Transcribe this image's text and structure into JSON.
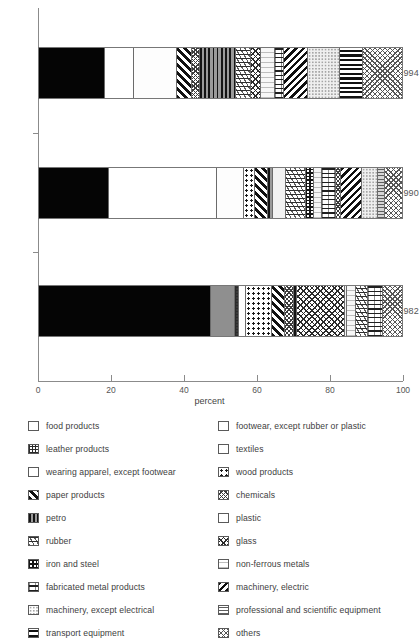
{
  "chart_data": {
    "type": "bar",
    "orientation": "horizontal",
    "stacked": true,
    "normalized_percent": true,
    "title": "",
    "xlabel": "percent",
    "ylabel": "",
    "xlim": [
      0,
      100
    ],
    "xticks": [
      0,
      20,
      40,
      60,
      80,
      100
    ],
    "grid": false,
    "legend_position": "bottom",
    "categories": [
      "1994",
      "1990",
      "1982"
    ],
    "series": [
      {
        "name": "food products",
        "key": "food",
        "values": [
          18.1,
          19.2,
          47.4
        ]
      },
      {
        "name": "footwear, except rubber or plastic",
        "key": "footwear",
        "values": [
          0.0,
          0.0,
          6.6
        ]
      },
      {
        "name": "leather products",
        "key": "leather",
        "values": [
          0.0,
          0.0,
          1.1
        ]
      },
      {
        "name": "textiles",
        "key": "textiles",
        "values": [
          8.2,
          29.8,
          1.9
        ]
      },
      {
        "name": "wearing apparel, except footwear",
        "key": "apparel",
        "values": [
          11.8,
          7.4,
          0.0
        ]
      },
      {
        "name": "wood products",
        "key": "wood",
        "values": [
          0.0,
          3.0,
          7.1
        ]
      },
      {
        "name": "paper products",
        "key": "paper",
        "values": [
          4.1,
          3.6,
          3.6
        ]
      },
      {
        "name": "chemicals",
        "key": "chem",
        "values": [
          2.2,
          1.6,
          2.5
        ]
      },
      {
        "name": "petro",
        "key": "petro",
        "values": [
          9.9,
          1.4,
          0.8
        ]
      },
      {
        "name": "plastic",
        "key": "plastic",
        "values": [
          0.0,
          3.6,
          0.5
        ]
      },
      {
        "name": "rubber",
        "key": "rubber",
        "values": [
          4.1,
          5.5,
          0.0
        ]
      },
      {
        "name": "glass",
        "key": "glass",
        "values": [
          2.7,
          0.0,
          13.4
        ]
      },
      {
        "name": "iron and steel",
        "key": "iron",
        "values": [
          0.0,
          2.2,
          0.0
        ]
      },
      {
        "name": "non-ferrous metals",
        "key": "nonferrous",
        "values": [
          3.8,
          2.2,
          2.5
        ]
      },
      {
        "name": "fabricated metal products",
        "key": "fabmetal",
        "values": [
          2.7,
          3.8,
          4.1
        ]
      },
      {
        "name": "machinery, electric",
        "key": "machelec",
        "values": [
          6.6,
          5.8,
          3.3
        ]
      },
      {
        "name": "machinery, except electrical",
        "key": "machexcl",
        "values": [
          8.8,
          4.4,
          0.0
        ]
      },
      {
        "name": "professional and scientific equipment",
        "key": "prof",
        "values": [
          0.0,
          1.9,
          0.0
        ]
      },
      {
        "name": "transport equipment",
        "key": "transport",
        "values": [
          6.3,
          0.0,
          0.0
        ]
      },
      {
        "name": "others",
        "key": "others",
        "values": [
          0.8,
          4.6,
          5.2
        ]
      }
    ],
    "bars": [
      {
        "label": "1994",
        "segments": [
          {
            "key": "food",
            "start": 0.0,
            "end": 18.1
          },
          {
            "key": "textiles",
            "start": 18.1,
            "end": 26.3
          },
          {
            "key": "apparel",
            "start": 26.3,
            "end": 38.1
          },
          {
            "key": "paper",
            "start": 38.1,
            "end": 42.2
          },
          {
            "key": "chem",
            "start": 42.2,
            "end": 44.4
          },
          {
            "key": "petro",
            "start": 44.4,
            "end": 54.3
          },
          {
            "key": "rubber",
            "start": 54.3,
            "end": 58.4
          },
          {
            "key": "glass",
            "start": 58.4,
            "end": 61.1
          },
          {
            "key": "nonferrous",
            "start": 61.1,
            "end": 64.9
          },
          {
            "key": "fabmetal",
            "start": 64.9,
            "end": 67.6
          },
          {
            "key": "machelec",
            "start": 67.6,
            "end": 74.2
          },
          {
            "key": "machexcl",
            "start": 74.2,
            "end": 83.0
          },
          {
            "key": "transport",
            "start": 83.0,
            "end": 89.3
          },
          {
            "key": "others",
            "start": 89.3,
            "end": 100.0
          }
        ]
      },
      {
        "label": "1990",
        "segments": [
          {
            "key": "food",
            "start": 0.0,
            "end": 19.2
          },
          {
            "key": "textiles",
            "start": 19.2,
            "end": 49.0
          },
          {
            "key": "apparel",
            "start": 49.0,
            "end": 56.4
          },
          {
            "key": "wood",
            "start": 56.4,
            "end": 59.4
          },
          {
            "key": "paper",
            "start": 59.4,
            "end": 63.0
          },
          {
            "key": "petro",
            "start": 63.0,
            "end": 64.4
          },
          {
            "key": "plastic",
            "start": 64.4,
            "end": 68.0
          },
          {
            "key": "rubber",
            "start": 68.0,
            "end": 73.5
          },
          {
            "key": "iron",
            "start": 73.5,
            "end": 75.7
          },
          {
            "key": "nonferrous",
            "start": 75.7,
            "end": 77.9
          },
          {
            "key": "fabmetal",
            "start": 77.9,
            "end": 81.7
          },
          {
            "key": "chem",
            "start": 81.7,
            "end": 83.3
          },
          {
            "key": "machelec",
            "start": 83.3,
            "end": 89.1
          },
          {
            "key": "machexcl",
            "start": 89.1,
            "end": 93.5
          },
          {
            "key": "prof",
            "start": 93.5,
            "end": 95.4
          },
          {
            "key": "others",
            "start": 95.4,
            "end": 100.0
          }
        ]
      },
      {
        "label": "1982",
        "segments": [
          {
            "key": "food",
            "start": 0.0,
            "end": 47.4
          },
          {
            "key": "footwear",
            "start": 47.4,
            "end": 54.0
          },
          {
            "key": "leather",
            "start": 54.0,
            "end": 55.1
          },
          {
            "key": "textiles",
            "start": 55.1,
            "end": 57.0
          },
          {
            "key": "wood",
            "start": 57.0,
            "end": 64.1
          },
          {
            "key": "paper",
            "start": 64.1,
            "end": 67.7
          },
          {
            "key": "chem",
            "start": 67.7,
            "end": 70.2
          },
          {
            "key": "petro",
            "start": 70.2,
            "end": 71.0
          },
          {
            "key": "glass",
            "start": 71.0,
            "end": 84.4
          },
          {
            "key": "plastic",
            "start": 84.4,
            "end": 84.9
          },
          {
            "key": "nonferrous",
            "start": 84.9,
            "end": 87.4
          },
          {
            "key": "rubber",
            "start": 87.4,
            "end": 90.7
          },
          {
            "key": "fabmetal",
            "start": 90.7,
            "end": 94.8
          },
          {
            "key": "others",
            "start": 94.8,
            "end": 100.0
          }
        ]
      }
    ]
  },
  "axis": {
    "x_tick_labels": [
      "0",
      "20",
      "40",
      "60",
      "80",
      "100"
    ],
    "x_title": "percent",
    "y_tick_labels": [
      "1994",
      "1990",
      "1982"
    ]
  },
  "legend": {
    "left_column": [
      {
        "label": "food products",
        "key": "food"
      },
      {
        "label": "leather products",
        "key": "leather"
      },
      {
        "label": "wearing apparel, except footwear",
        "key": "apparel"
      },
      {
        "label": "paper products",
        "key": "paper"
      },
      {
        "label": "petro",
        "key": "petro"
      },
      {
        "label": "rubber",
        "key": "rubber"
      },
      {
        "label": "iron and steel",
        "key": "iron"
      },
      {
        "label": "fabricated metal products",
        "key": "fabmetal"
      },
      {
        "label": "machinery, except electrical",
        "key": "machexcl"
      },
      {
        "label": "transport equipment",
        "key": "transport"
      }
    ],
    "right_column": [
      {
        "label": "footwear, except rubber or plastic",
        "key": "footwear"
      },
      {
        "label": "textiles",
        "key": "textiles"
      },
      {
        "label": "wood products",
        "key": "wood"
      },
      {
        "label": "chemicals",
        "key": "chem"
      },
      {
        "label": "plastic",
        "key": "plastic"
      },
      {
        "label": "glass",
        "key": "glass"
      },
      {
        "label": "non-ferrous metals",
        "key": "nonferrous"
      },
      {
        "label": "machinery, electric",
        "key": "machelec"
      },
      {
        "label": "professional and scientific equipment",
        "key": "prof"
      },
      {
        "label": "others",
        "key": "others"
      }
    ]
  }
}
